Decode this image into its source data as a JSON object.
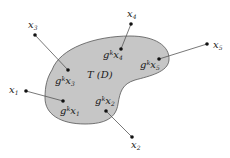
{
  "diagram": {
    "region": {
      "label": "T (D)",
      "fill": "#c6c6c6",
      "stroke": "#555555"
    },
    "line_color": "#555555",
    "dot_color": "#111111",
    "points": [
      {
        "name": "x1",
        "base": "x",
        "sub": "1",
        "outer": [
          26,
          91
        ],
        "inner": [
          63,
          101
        ],
        "image_prefix": "g",
        "image_sup": "k",
        "image_base": "x",
        "image_sub": "1"
      },
      {
        "name": "x2",
        "base": "x",
        "sub": "2",
        "outer": [
          132,
          137
        ],
        "inner": [
          106,
          111
        ],
        "image_prefix": "g",
        "image_sup": "k",
        "image_base": "x",
        "image_sub": "2"
      },
      {
        "name": "x3",
        "base": "x",
        "sub": "3",
        "outer": [
          35,
          35
        ],
        "inner": [
          68,
          70
        ],
        "image_prefix": "g",
        "image_sup": "k",
        "image_base": "x",
        "image_sub": "3"
      },
      {
        "name": "x4",
        "base": "x",
        "sub": "4",
        "outer": [
          131,
          24
        ],
        "inner": [
          121,
          49
        ],
        "image_prefix": "g",
        "image_sup": "k",
        "image_base": "x",
        "image_sub": "4"
      },
      {
        "name": "x5",
        "base": "x",
        "sub": "5",
        "outer": [
          207,
          44
        ],
        "inner": [
          159,
          59
        ],
        "image_prefix": "g",
        "image_sup": "k",
        "image_base": "x",
        "image_sub": "5"
      }
    ]
  }
}
